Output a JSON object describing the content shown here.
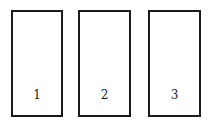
{
  "diagram": {
    "type": "numbered-rectangles",
    "stroke_color": "#1c1c1c",
    "fill_color": "#ffffff",
    "boxes": [
      {
        "label": "1",
        "x": 11,
        "y": 10,
        "width": 48,
        "height": 103
      },
      {
        "label": "2",
        "x": 78,
        "y": 10,
        "width": 49,
        "height": 103
      },
      {
        "label": "3",
        "x": 148,
        "y": 10,
        "width": 49,
        "height": 103
      }
    ]
  }
}
